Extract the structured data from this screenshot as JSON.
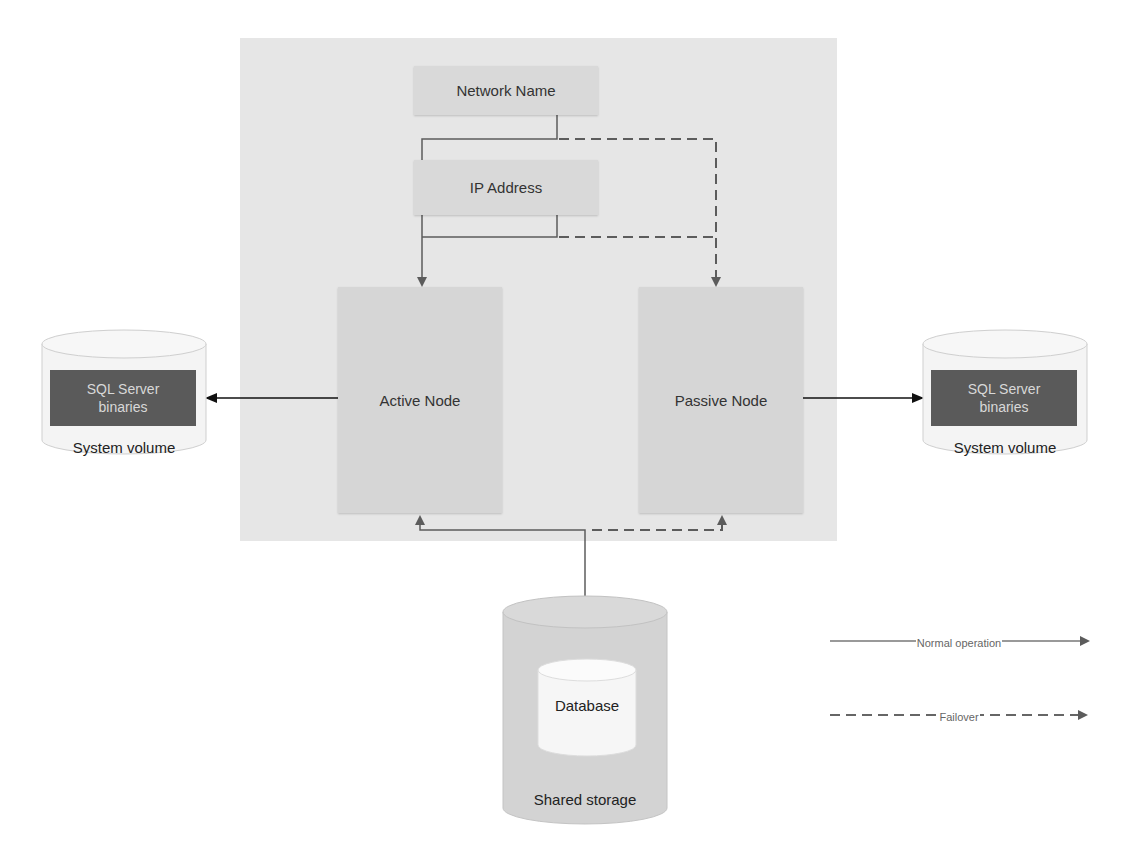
{
  "diagram": {
    "cluster": {
      "network_name": "Network Name",
      "ip_address": "IP Address",
      "active_node": "Active Node",
      "passive_node": "Passive Node"
    },
    "left_volume": {
      "inner_label_line1": "SQL Server",
      "inner_label_line2": "binaries",
      "label": "System volume"
    },
    "right_volume": {
      "inner_label_line1": "SQL Server",
      "inner_label_line2": "binaries",
      "label": "System volume"
    },
    "shared_storage": {
      "inner_label": "Database",
      "label": "Shared storage"
    },
    "legend": {
      "normal": "Normal operation",
      "failover": "Failover"
    },
    "colors": {
      "cluster_bg": "#e6e6e6",
      "box_bg": "#d9d9d9",
      "binaries_bg": "#5a5a5a",
      "line": "#555555"
    }
  }
}
